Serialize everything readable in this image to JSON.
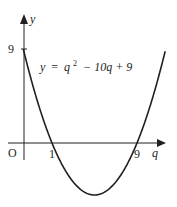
{
  "chart_data": {
    "type": "line",
    "title": "",
    "equation": {
      "lhs": "y",
      "equals": "=",
      "var": "q",
      "exp": "2",
      "rest": "− 10q + 9"
    },
    "xlabel": "q",
    "ylabel": "y",
    "origin_label": "O",
    "x_tick_labels": [
      "1",
      "9"
    ],
    "y_tick_labels": [
      "9"
    ],
    "series": [
      {
        "name": "y = q^2 - 10q + 9",
        "function": "q^2 - 10q + 9",
        "x_intercepts": [
          1,
          9
        ],
        "y_intercept": 9,
        "vertex": [
          5,
          -16
        ]
      }
    ],
    "schematic": true,
    "grid": false,
    "legend": "none",
    "colors": {
      "curve": "#231f20",
      "axes": "#231f20"
    }
  }
}
